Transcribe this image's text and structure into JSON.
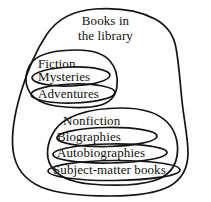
{
  "diagram": {
    "kind": "euler-diagram",
    "title_line_1": "Books in",
    "title_line_2": "the library",
    "stroke_color": "#141414",
    "background_color": "#ffffff",
    "text_color": "#111111",
    "regions": [
      {
        "id": "books-in-the-library",
        "label": "Books in the library",
        "shape": "blob",
        "level": 0
      },
      {
        "id": "fiction",
        "label": "Fiction",
        "shape": "blob",
        "level": 1,
        "parent": "books-in-the-library"
      },
      {
        "id": "mysteries",
        "label": "Mysteries",
        "shape": "ellipse",
        "level": 2,
        "parent": "fiction"
      },
      {
        "id": "adventures",
        "label": "Adventures",
        "shape": "ellipse",
        "level": 2,
        "parent": "fiction"
      },
      {
        "id": "nonfiction",
        "label": "Nonfiction",
        "shape": "blob",
        "level": 1,
        "parent": "books-in-the-library"
      },
      {
        "id": "biographies",
        "label": "Biographies",
        "shape": "ellipse",
        "level": 2,
        "parent": "nonfiction"
      },
      {
        "id": "autobiographies",
        "label": "Autobiographies",
        "shape": "ellipse",
        "level": 2,
        "parent": "nonfiction"
      },
      {
        "id": "subject-matter-books",
        "label": "Subject-matter books",
        "shape": "ellipse",
        "level": 2,
        "parent": "nonfiction"
      }
    ],
    "labels": {
      "fiction": "Fiction",
      "mysteries": "Mysteries",
      "adventures": "Adventures",
      "nonfiction": "Nonfiction",
      "biographies": "Biographies",
      "autobiographies": "Autobiographies",
      "subject_matter_books": "Subject-matter books"
    }
  }
}
